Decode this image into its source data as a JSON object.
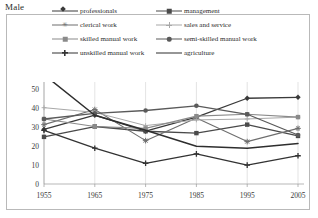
{
  "chart_title": "Male",
  "legend": {
    "items": [
      {
        "label": "professionals",
        "marker": "diamond",
        "color": "#3a3a3a",
        "width": 1.3
      },
      {
        "label": "management",
        "marker": "square",
        "color": "#4a4a4a",
        "width": 1.3
      },
      {
        "label": "clerical work",
        "marker": "star",
        "color": "#6e6e6e",
        "width": 1.1
      },
      {
        "label": "sales and service",
        "marker": "plus-thin",
        "color": "#a8a8a8",
        "width": 1.0
      },
      {
        "label": "skilled manual work",
        "marker": "square",
        "color": "#8a8a8a",
        "width": 1.1
      },
      {
        "label": "semi-skilled manual work",
        "marker": "circle",
        "color": "#5a5a5a",
        "width": 1.3
      },
      {
        "label": "unskilled manual work",
        "marker": "plus",
        "color": "#333333",
        "width": 1.3
      },
      {
        "label": "agriculture",
        "marker": "none",
        "color": "#2e2e2e",
        "width": 1.5
      }
    ]
  },
  "chart_data": {
    "type": "line",
    "title": "Male",
    "xlabel": "",
    "ylabel": "",
    "x": [
      1955,
      1965,
      1975,
      1985,
      1995,
      2005
    ],
    "xtick_labels": [
      "1955",
      "1965",
      "1975",
      "1985",
      "1995",
      "2005"
    ],
    "ytick_labels": [
      "0",
      "10",
      "20",
      "30",
      "40",
      "50"
    ],
    "yticks": [
      0,
      10,
      20,
      30,
      40,
      50
    ],
    "ylim": [
      0,
      52
    ],
    "grid": "vertical",
    "legend_position": "top",
    "series": [
      {
        "name": "professionals",
        "marker": "diamond",
        "color": "#3a3a3a",
        "width": 1.3,
        "values": [
          29,
          36.5,
          28,
          35.5,
          45.5,
          46
        ]
      },
      {
        "name": "management",
        "marker": "square",
        "color": "#4a4a4a",
        "width": 1.3,
        "values": [
          25,
          30.5,
          28,
          27,
          31.5,
          25.5
        ]
      },
      {
        "name": "clerical work",
        "marker": "star",
        "color": "#6e6e6e",
        "width": 1.1,
        "values": [
          31.5,
          39.5,
          23,
          35,
          22.5,
          29.5
        ]
      },
      {
        "name": "sales and service",
        "marker": "plus-thin",
        "color": "#a8a8a8",
        "width": 1.0,
        "values": [
          40.5,
          38,
          31,
          34,
          34.5,
          35.5
        ]
      },
      {
        "name": "skilled manual work",
        "marker": "square",
        "color": "#8a8a8a",
        "width": 1.1,
        "values": [
          34.5,
          30.5,
          29.5,
          36,
          37,
          35.5
        ]
      },
      {
        "name": "semi-skilled manual work",
        "marker": "circle",
        "color": "#5a5a5a",
        "width": 1.3,
        "values": [
          34.5,
          37.5,
          39,
          41.5,
          37,
          26
        ]
      },
      {
        "name": "unskilled manual work",
        "marker": "plus",
        "color": "#333333",
        "width": 1.3,
        "values": [
          28.5,
          19,
          11,
          16,
          10,
          15
        ]
      },
      {
        "name": "agriculture",
        "marker": "none",
        "color": "#2e2e2e",
        "width": 1.5,
        "values": [
          58,
          36.5,
          28.5,
          20,
          19,
          21.5
        ]
      }
    ]
  }
}
